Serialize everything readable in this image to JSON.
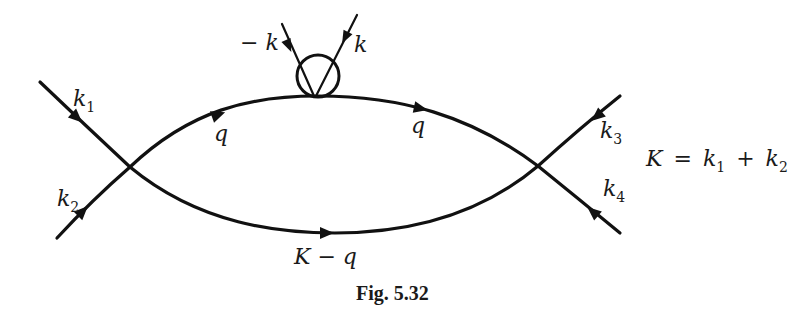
{
  "figure": {
    "caption": "Fig. 5.32",
    "relation": {
      "lhs": "K",
      "eq": "=",
      "k1": "k",
      "k1_sub": "1",
      "plus": "+",
      "k2": "k",
      "k2_sub": "2"
    }
  },
  "lines": {
    "k1": {
      "label": "k",
      "sub": "1"
    },
    "k2": {
      "label": "k",
      "sub": "2"
    },
    "k3": {
      "label": "k",
      "sub": "3"
    },
    "k4": {
      "label": "k",
      "sub": "4"
    },
    "q_left": {
      "label": "q"
    },
    "q_right": {
      "label": "q"
    },
    "bottom": {
      "label": "K − q"
    },
    "ext_minus_k": {
      "label": "− k"
    },
    "ext_k": {
      "label": "k"
    }
  },
  "colors": {
    "ink": "#111111",
    "background": "#ffffff"
  }
}
